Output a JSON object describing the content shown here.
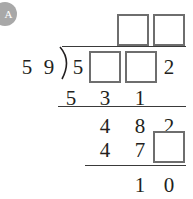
{
  "badge": {
    "label": "A",
    "color": "#a8a8a8"
  },
  "problem": {
    "type": "long-division",
    "divisor_digits": [
      "5",
      "9"
    ],
    "dividend_cells": [
      {
        "kind": "digit",
        "value": "5"
      },
      {
        "kind": "box",
        "value": ""
      },
      {
        "kind": "box",
        "value": ""
      },
      {
        "kind": "digit",
        "value": "2"
      }
    ],
    "quotient_cells": [
      {
        "kind": "box",
        "value": ""
      },
      {
        "kind": "box",
        "value": ""
      }
    ],
    "work_rows": [
      {
        "name": "first-partial-product",
        "cells": [
          {
            "kind": "digit",
            "value": "5"
          },
          {
            "kind": "digit",
            "value": "3"
          },
          {
            "kind": "digit",
            "value": "1"
          }
        ]
      },
      {
        "name": "first-remainder",
        "cells": [
          {
            "kind": "digit",
            "value": "4"
          },
          {
            "kind": "digit",
            "value": "8"
          },
          {
            "kind": "digit",
            "value": "2"
          }
        ]
      },
      {
        "name": "second-partial-product",
        "cells": [
          {
            "kind": "digit",
            "value": "4"
          },
          {
            "kind": "digit",
            "value": "7"
          },
          {
            "kind": "box",
            "value": ""
          }
        ]
      },
      {
        "name": "final-remainder",
        "cells": [
          {
            "kind": "digit",
            "value": "1"
          },
          {
            "kind": "digit",
            "value": "0"
          }
        ]
      }
    ],
    "ink_color": "#231f20",
    "box_border_color": "#6e6e6e",
    "rule_color": "#3a3a3a"
  }
}
